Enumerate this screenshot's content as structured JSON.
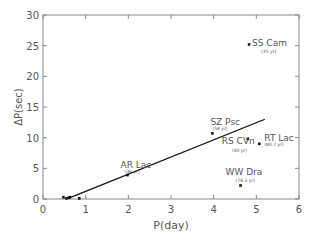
{
  "chart_data": {
    "type": "scatter",
    "title": "",
    "xlabel": "P(day)",
    "ylabel": "ΔP(sec)",
    "xlim": [
      0,
      6
    ],
    "ylim": [
      0,
      30
    ],
    "x_ticks": [
      0,
      1,
      2,
      3,
      4,
      5,
      6
    ],
    "y_ticks": [
      0,
      5,
      10,
      15,
      20,
      25,
      30
    ],
    "grid": false,
    "legend": null,
    "points": [
      {
        "name": "SS Cam",
        "note": "(35 yr)",
        "x": 4.83,
        "y": 25.2
      },
      {
        "name": "SZ Psc",
        "note": "(58 yr)",
        "x": 3.97,
        "y": 10.7
      },
      {
        "name": "RS CVn",
        "note": "(40 yr)",
        "x": 4.8,
        "y": 9.8
      },
      {
        "name": "RT Lac",
        "note": "(80.7 yr)",
        "x": 5.07,
        "y": 9.0
      },
      {
        "name": "WW Dra",
        "note": "(78.3 yr)",
        "x": 4.63,
        "y": 2.2
      },
      {
        "name": "AR Lac",
        "note": "(36 yr)",
        "x": 1.98,
        "y": 3.9
      },
      {
        "name": "",
        "note": "",
        "x": 0.48,
        "y": 0.3
      },
      {
        "name": "",
        "note": "",
        "x": 0.55,
        "y": 0.1
      },
      {
        "name": "",
        "note": "",
        "x": 0.6,
        "y": 0.2
      },
      {
        "name": "",
        "note": "",
        "x": 0.63,
        "y": 0.3
      },
      {
        "name": "",
        "note": "",
        "x": 0.85,
        "y": 0.1
      }
    ],
    "fit_line": {
      "x": [
        0.62,
        5.2
      ],
      "y": [
        0.2,
        13.0
      ]
    }
  }
}
